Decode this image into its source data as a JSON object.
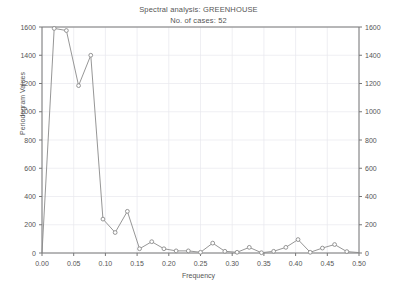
{
  "title": {
    "main": "Spectral analysis: GREENHOUSE",
    "sub": "No. of cases: 52"
  },
  "axes": {
    "xlabel": "Frequency",
    "ylabel": "Periodogram Values",
    "x_ticks": [
      "0.00",
      "0.05",
      "0.10",
      "0.15",
      "0.20",
      "0.25",
      "0.30",
      "0.35",
      "0.40",
      "0.45",
      "0.50"
    ],
    "y_ticks": [
      "0",
      "200",
      "400",
      "600",
      "800",
      "1000",
      "1200",
      "1400",
      "1600"
    ],
    "y_ticks_right": [
      "0",
      "200",
      "400",
      "600",
      "800",
      "1000",
      "1200",
      "1400",
      "1600"
    ]
  },
  "style": {
    "line_color": "#8a8a8a",
    "marker_color": "#8a8a8a",
    "grid_color": "#e8e8ee",
    "frame_color": "#777777",
    "background": "#ffffff"
  },
  "chart_data": {
    "type": "line",
    "title": "Spectral analysis: GREENHOUSE",
    "subtitle": "No. of cases: 52",
    "xlabel": "Frequency",
    "ylabel": "Periodogram Values",
    "xlim": [
      0.0,
      0.5
    ],
    "ylim": [
      0,
      1600
    ],
    "xticks": [
      0.0,
      0.05,
      0.1,
      0.15,
      0.2,
      0.25,
      0.3,
      0.35,
      0.4,
      0.45,
      0.5
    ],
    "yticks": [
      0,
      200,
      400,
      600,
      800,
      1000,
      1200,
      1400,
      1600
    ],
    "grid": true,
    "legend": null,
    "marker": "open-circle",
    "n_cases": 52,
    "x": [
      0.0,
      0.019231,
      0.038462,
      0.057692,
      0.076923,
      0.096154,
      0.115385,
      0.134615,
      0.153846,
      0.173077,
      0.192308,
      0.211538,
      0.230769,
      0.25,
      0.269231,
      0.288462,
      0.307692,
      0.326923,
      0.346154,
      0.365385,
      0.384615,
      0.403846,
      0.423077,
      0.442308,
      0.461538,
      0.480769,
      0.5
    ],
    "y": [
      0,
      1590,
      1575,
      1185,
      1400,
      240,
      145,
      295,
      30,
      80,
      30,
      15,
      15,
      5,
      70,
      12,
      5,
      40,
      2,
      12,
      40,
      95,
      5,
      35,
      60,
      10,
      3
    ],
    "series": [
      {
        "name": "Periodogram",
        "values": [
          0,
          1590,
          1575,
          1185,
          1400,
          240,
          145,
          295,
          30,
          80,
          30,
          15,
          15,
          5,
          70,
          12,
          5,
          40,
          2,
          12,
          40,
          95,
          5,
          35,
          60,
          10,
          3
        ]
      }
    ]
  }
}
